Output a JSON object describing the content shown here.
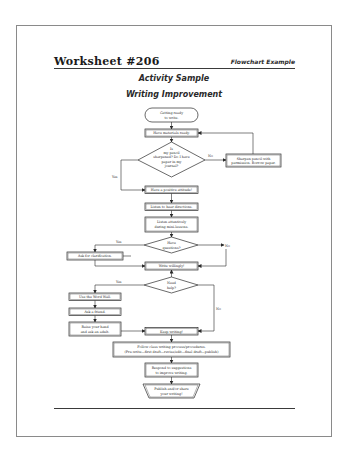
{
  "header": {
    "title": "Worksheet #206",
    "subtitle": "Flowchart Example"
  },
  "activity": {
    "title": "Activity Sample",
    "subtitle": "Writing Improvement"
  },
  "flowchart": {
    "nodes": {
      "start": [
        "Getting ready",
        "to write."
      ],
      "materials": [
        "Have materials ready."
      ],
      "pencil_decision": [
        "Is",
        "my pencil",
        "sharpened? Do I have",
        "paper in my",
        "journal?"
      ],
      "sharpen": [
        "Sharpen pencil with",
        "permission. Borrow paper."
      ],
      "attitude": [
        "Have a positive attitude!"
      ],
      "directions": [
        "Listen to hear directions."
      ],
      "attentive": [
        "Listen attentively",
        "during mini-lessons."
      ],
      "questions_decision": [
        "Have",
        "questions?"
      ],
      "clarification": [
        "Ask for clarification."
      ],
      "write": [
        "Write willingly!"
      ],
      "help_decision": [
        "Need",
        "help?"
      ],
      "word_wall": [
        "Use the Word Wall."
      ],
      "friend": [
        "Ask a friend."
      ],
      "adult": [
        "Raise your hand",
        "and ask an adult."
      ],
      "keep_writing": [
        "Keep writing!"
      ],
      "process": [
        "Follow class writing process/procedures.",
        "(Pre-write—first draft—revise/edit—final draft—publish)"
      ],
      "respond": [
        "Respond to suggestions",
        "to improve writing."
      ],
      "publish": [
        "Publish and/or share",
        "your writing!"
      ]
    },
    "edge_labels": {
      "pencil_no": "No",
      "pencil_yes": "Yes",
      "questions_yes": "Yes",
      "questions_no": "No",
      "help_yes": "Yes",
      "help_no": "No"
    }
  }
}
